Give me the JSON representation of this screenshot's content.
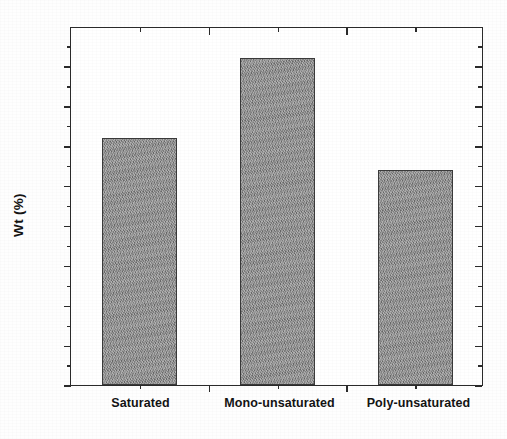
{
  "chart_data": {
    "type": "bar",
    "title": "",
    "subtitle": "",
    "xlabel": "",
    "ylabel": "Wt (%)",
    "categories": [
      "Saturated",
      "Mono-unsaturated",
      "Poly-unsaturated"
    ],
    "values": [
      31,
      41,
      27
    ],
    "series": [
      {
        "name": "Wt (%)",
        "values": [
          31,
          41,
          27
        ]
      }
    ],
    "ylim": [
      0,
      45
    ],
    "xlim": [
      0,
      3
    ],
    "y_major_ticks": [
      0,
      5,
      10,
      15,
      20,
      25,
      30,
      35,
      40,
      45
    ],
    "y_minor_ticks": [
      2.5,
      7.5,
      12.5,
      17.5,
      22.5,
      27.5,
      32.5,
      37.5,
      42.5
    ],
    "y_tick_labels": [
      "0",
      "5",
      "10",
      "15",
      "20",
      "25",
      "30",
      "35",
      "40",
      "45"
    ],
    "grid": false,
    "legend": false,
    "legend_position": "none",
    "frame": "full-box",
    "annotations": [],
    "colors": {
      "bar_fill": "#8d8d8d",
      "bar_edge": "#3a3a3a",
      "axis": "#2a2a2a",
      "text": "#141414",
      "background": "#ffffff"
    }
  }
}
